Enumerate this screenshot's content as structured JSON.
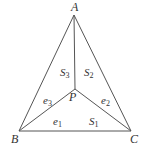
{
  "diagram": {
    "type": "geometry",
    "line_color": "#555555",
    "vertices": {
      "A": {
        "label": "A",
        "x": 74,
        "y": 15
      },
      "B": {
        "label": "B",
        "x": 19,
        "y": 131
      },
      "C": {
        "label": "C",
        "x": 131,
        "y": 131
      },
      "P": {
        "label": "P",
        "x": 75,
        "y": 89
      }
    },
    "edges": [
      {
        "from": "A",
        "to": "B"
      },
      {
        "from": "B",
        "to": "C"
      },
      {
        "from": "C",
        "to": "A"
      },
      {
        "from": "P",
        "to": "A"
      },
      {
        "from": "P",
        "to": "B"
      },
      {
        "from": "P",
        "to": "C"
      }
    ],
    "labels": {
      "A": "A",
      "B": "B",
      "C": "C",
      "P": "P",
      "S1": {
        "base": "S",
        "sub": "1"
      },
      "S2": {
        "base": "S",
        "sub": "2"
      },
      "S3": {
        "base": "S",
        "sub": "3"
      },
      "e1": {
        "base": "e",
        "sub": "1"
      },
      "e2": {
        "base": "e",
        "sub": "2"
      },
      "e3": {
        "base": "e",
        "sub": "3"
      }
    }
  }
}
